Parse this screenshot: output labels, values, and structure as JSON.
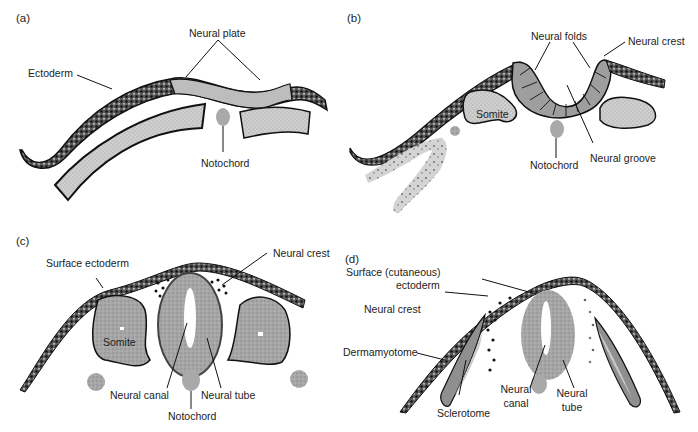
{
  "figure": {
    "panels": [
      {
        "id": "a",
        "label": "(a)",
        "annotations": [
          "Ectoderm",
          "Neural plate",
          "Notochord"
        ]
      },
      {
        "id": "b",
        "label": "(b)",
        "annotations": [
          "Neural folds",
          "Neural crest",
          "Somite",
          "Notochord",
          "Neural groove"
        ]
      },
      {
        "id": "c",
        "label": "(c)",
        "annotations": [
          "Surface ectoderm",
          "Neural crest",
          "Somite",
          "Neural canal",
          "Neural tube",
          "Notochord"
        ]
      },
      {
        "id": "d",
        "label": "(d)",
        "annotations": [
          "Surface (cutaneous)",
          "ectoderm",
          "Neural crest",
          "Dermamyotome",
          "Sclerotome",
          "Neural",
          "canal",
          "Neural",
          "tube"
        ]
      }
    ]
  },
  "colors": {
    "ectoderm_dark": "#2a2a2a",
    "tissue_gray": "#9a9a9a",
    "mesoderm_light": "#c8c8c8",
    "notochord": "#a8a8a8",
    "outline": "#111111"
  }
}
